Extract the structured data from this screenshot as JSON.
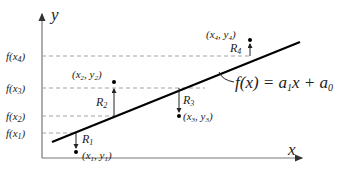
{
  "diagram": {
    "type": "linear-regression-residuals",
    "axes": {
      "x_label": "x",
      "y_label": "y"
    },
    "y_ticks": [
      "f(x4)",
      "f(x3)",
      "f(x2)",
      "f(x1)"
    ],
    "y_ticks_display": {
      "f4_base": "f(x",
      "f4_sub": "4",
      "f3_base": "f(x",
      "f3_sub": "3",
      "f2_base": "f(x",
      "f2_sub": "2",
      "f1_base": "f(x",
      "f1_sub": "1",
      "close": ")"
    },
    "points": [
      {
        "label": "(x1, y1)",
        "x_sub": "1",
        "y_sub": "1",
        "residual": "R1",
        "res_sub": "1"
      },
      {
        "label": "(x2, y2)",
        "x_sub": "2",
        "y_sub": "2",
        "residual": "R2",
        "res_sub": "2"
      },
      {
        "label": "(x3, y3)",
        "x_sub": "3",
        "y_sub": "3",
        "residual": "R3",
        "res_sub": "3"
      },
      {
        "label": "(x4, y4)",
        "x_sub": "4",
        "y_sub": "4",
        "residual": "R4",
        "res_sub": "4"
      }
    ],
    "equation": {
      "text": "f(x) = a1x + a0",
      "lhs": "f(x) = a",
      "a1_sub": "1",
      "mid": "x + a",
      "a0_sub": "0"
    },
    "colors": {
      "line": "#000000",
      "dashed": "#888888",
      "axis": "#777777",
      "text": "#222222"
    }
  }
}
